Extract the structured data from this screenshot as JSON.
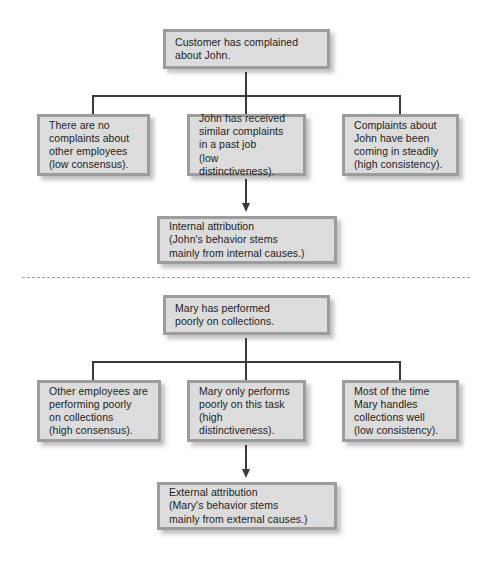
{
  "diagram": {
    "type": "flowchart",
    "divider": {
      "style": "dashed",
      "color": "#9a9a9a"
    },
    "colors": {
      "box_fill": "#dcdcdc",
      "box_border": "#9c9c9c",
      "connector": "#3a3a3a",
      "text": "#1c1c1c"
    },
    "sections": [
      {
        "id": "john",
        "root": {
          "label": "Customer has complained\nabout John.",
          "line1": "Customer has complained",
          "line2": "about John."
        },
        "criteria": [
          {
            "id": "consensus",
            "label": "There are no\ncomplaints about\nother employees\n(low consensus).",
            "dimension": "consensus",
            "level": "low"
          },
          {
            "id": "distinctiveness",
            "label": "John has received\nsimilar complaints\nin a past job\n(low distinctiveness).",
            "dimension": "distinctiveness",
            "level": "low"
          },
          {
            "id": "consistency",
            "label": "Complaints about\nJohn have been\ncoming in steadily\n(high consistency).",
            "dimension": "consistency",
            "level": "high"
          }
        ],
        "conclusion": {
          "label": "Internal attribution\n(John's behavior stems\nmainly from internal causes.)",
          "attribution": "Internal attribution"
        }
      },
      {
        "id": "mary",
        "root": {
          "label": "Mary has performed\npoorly on collections.",
          "line1": "Mary has performed",
          "line2": "poorly on collections."
        },
        "criteria": [
          {
            "id": "consensus",
            "label": "Other employees are\nperforming poorly\non collections\n(high consensus).",
            "dimension": "consensus",
            "level": "high"
          },
          {
            "id": "distinctiveness",
            "label": "Mary only performs\npoorly on this task\n(high distinctiveness).",
            "dimension": "distinctiveness",
            "level": "high"
          },
          {
            "id": "consistency",
            "label": "Most of the time\nMary handles\ncollections well\n(low consistency).",
            "dimension": "consistency",
            "level": "low"
          }
        ],
        "conclusion": {
          "label": "External attribution\n(Mary's behavior stems\nmainly from external causes.)",
          "attribution": "External attribution"
        }
      }
    ]
  }
}
